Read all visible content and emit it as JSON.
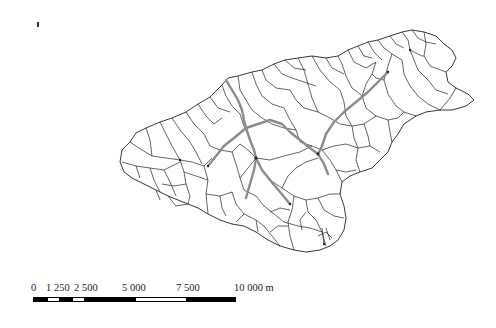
{
  "map": {
    "type": "watershed sub-basin map",
    "background_color": "#ffffff",
    "basin_line_color": "#222222",
    "river_color": "#8c8c8c",
    "north_marker": "north-arrow-icon"
  },
  "scale_bar": {
    "unit": "m",
    "labels": [
      "0",
      "1 250",
      "2 500",
      "5 000",
      "7 500",
      "10 000 m"
    ],
    "label_positions_px": [
      33,
      55,
      81,
      127,
      180,
      231
    ],
    "segments": [
      {
        "color": "black",
        "width": 14
      },
      {
        "color": "white",
        "width": 11
      },
      {
        "color": "black",
        "width": 14
      },
      {
        "color": "white",
        "width": 11
      },
      {
        "color": "black",
        "width": 52
      },
      {
        "color": "white",
        "width": 50
      },
      {
        "color": "black",
        "width": 51
      }
    ]
  }
}
